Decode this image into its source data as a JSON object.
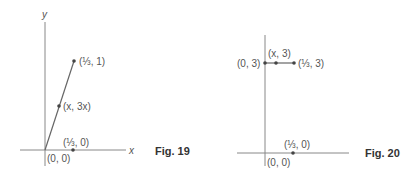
{
  "figures": [
    {
      "caption": "Fig. 19",
      "axis_labels": {
        "x": "x",
        "y": "y"
      },
      "points": [
        {
          "label": "(⅓, 1)"
        },
        {
          "label": "(x, 3x)"
        },
        {
          "label": "(⅓, 0)"
        },
        {
          "label": "(0, 0)"
        }
      ]
    },
    {
      "caption": "Fig. 20",
      "points": [
        {
          "label": "(0, 3)"
        },
        {
          "label": "(x, 3)"
        },
        {
          "label": "(⅓, 3)"
        },
        {
          "label": "(⅓, 0)"
        },
        {
          "label": "(0, 0)"
        }
      ]
    }
  ],
  "colors": {
    "line": "#666666",
    "point": "#444444",
    "text": "#555555"
  }
}
